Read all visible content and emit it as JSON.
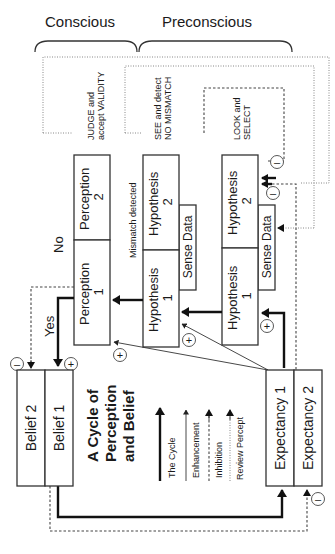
{
  "header": {
    "conscious_label": "Conscious",
    "preconscious_label": "Preconscious"
  },
  "title": {
    "line1": "A Cycle of",
    "line2": "Perception",
    "line3": "and Belief"
  },
  "stages": {
    "conscious_stage": {
      "line1": "JUDGE and",
      "line2": "accept VALIDITY"
    },
    "see_stage": {
      "line1": "SEE and detect",
      "line2": "NO MISMATCH"
    },
    "look_stage": {
      "line1": "LOOK and",
      "line2": "SELECT"
    }
  },
  "boxes": {
    "perception_2": {
      "line1": "Perception",
      "line2": "2"
    },
    "perception_1": {
      "line1": "Perception",
      "line2": "1"
    },
    "mid_hypothesis_2": {
      "line1": "Hypothesis",
      "line2": "2"
    },
    "mid_hypothesis_1": {
      "line1": "Hypothesis",
      "line2": "1"
    },
    "mid_sense_data": "Sense Data",
    "right_hypothesis_2": {
      "line1": "Hypothesis",
      "line2": "2"
    },
    "right_hypothesis_1": {
      "line1": "Hypothesis",
      "line2": "1"
    },
    "right_sense_data": "Sense Data",
    "belief_2": "Belief 2",
    "belief_1": "Belief 1",
    "expectancy_1": "Expectancy 1",
    "expectancy_2": "Expectancy 2"
  },
  "decisions": {
    "no_label": "No",
    "yes_label": "Yes",
    "mismatch_label": "Mismatch detected"
  },
  "markers": {
    "plus": "+",
    "minus": "–"
  },
  "legend": {
    "items": [
      {
        "label": "The Cycle",
        "style": "thick-solid"
      },
      {
        "label": "Enhancement",
        "style": "thin-solid"
      },
      {
        "label": "Inhibition",
        "style": "dashed"
      },
      {
        "label": "Review Percept",
        "style": "dotted"
      }
    ]
  },
  "colors": {
    "line": "#222222",
    "box_stroke": "#333333",
    "background": "#ffffff"
  }
}
